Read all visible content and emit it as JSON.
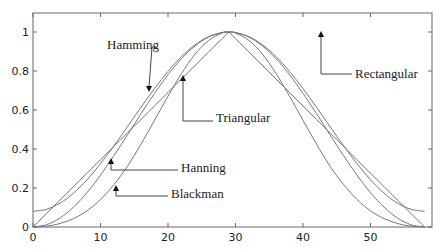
{
  "chart_data": {
    "type": "line",
    "title": "",
    "xlabel": "",
    "ylabel": "",
    "xlim": [
      0,
      59
    ],
    "ylim": [
      0,
      1.1
    ],
    "grid": false,
    "x_ticks": [
      0,
      10,
      20,
      30,
      40,
      50
    ],
    "y_ticks": [
      0,
      0.2,
      0.4,
      0.6,
      0.8,
      1
    ],
    "y_tick_labels": [
      "0",
      "0.2",
      "0.4",
      "0.6",
      "0.8",
      "1"
    ],
    "x": [
      0,
      2,
      4,
      6,
      8,
      10,
      12,
      14,
      16,
      18,
      20,
      22,
      24,
      26,
      28,
      29,
      30,
      32,
      34,
      36,
      38,
      40,
      42,
      44,
      46,
      48,
      50,
      52,
      54,
      56,
      58
    ],
    "series": [
      {
        "name": "Hamming",
        "values": [
          0.08,
          0.091,
          0.122,
          0.174,
          0.242,
          0.325,
          0.417,
          0.515,
          0.614,
          0.71,
          0.798,
          0.874,
          0.934,
          0.976,
          0.997,
          1.0,
          0.997,
          0.976,
          0.934,
          0.874,
          0.798,
          0.71,
          0.614,
          0.515,
          0.417,
          0.325,
          0.242,
          0.174,
          0.122,
          0.091,
          0.08
        ]
      },
      {
        "name": "Hanning",
        "values": [
          0.0,
          0.012,
          0.046,
          0.102,
          0.176,
          0.266,
          0.366,
          0.473,
          0.581,
          0.685,
          0.781,
          0.863,
          0.928,
          0.974,
          0.997,
          1.0,
          0.997,
          0.974,
          0.928,
          0.863,
          0.781,
          0.685,
          0.581,
          0.473,
          0.366,
          0.266,
          0.176,
          0.102,
          0.046,
          0.012,
          0.0
        ]
      },
      {
        "name": "Blackman",
        "values": [
          0.0,
          0.004,
          0.018,
          0.043,
          0.083,
          0.141,
          0.218,
          0.312,
          0.425,
          0.547,
          0.671,
          0.787,
          0.886,
          0.956,
          0.995,
          1.0,
          0.995,
          0.956,
          0.886,
          0.787,
          0.671,
          0.547,
          0.425,
          0.312,
          0.218,
          0.141,
          0.083,
          0.043,
          0.018,
          0.004,
          0.0
        ]
      },
      {
        "name": "Triangular",
        "values": [
          0.0,
          0.069,
          0.138,
          0.207,
          0.276,
          0.345,
          0.414,
          0.483,
          0.552,
          0.621,
          0.69,
          0.759,
          0.828,
          0.897,
          0.966,
          1.0,
          0.966,
          0.897,
          0.828,
          0.759,
          0.69,
          0.621,
          0.552,
          0.483,
          0.414,
          0.345,
          0.276,
          0.207,
          0.138,
          0.069,
          0.0
        ]
      },
      {
        "name": "Rectangular",
        "values": [
          1,
          1,
          1,
          1,
          1,
          1,
          1,
          1,
          1,
          1,
          1,
          1,
          1,
          1,
          1,
          1,
          1,
          1,
          1,
          1,
          1,
          1,
          1,
          1,
          1,
          1,
          1,
          1,
          1,
          1,
          1
        ]
      }
    ],
    "annotations": [
      {
        "label": "Hamming",
        "text_x": 107,
        "text_y": 49,
        "elbow": [
          152,
          47
        ],
        "tip": [
          149,
          92
        ],
        "dir": "down"
      },
      {
        "label": "Triangular",
        "text_x": 216,
        "text_y": 122,
        "elbow": [
          183,
          121
        ],
        "tip": [
          183,
          75
        ],
        "dir": "up"
      },
      {
        "label": "Rectangular",
        "text_x": 355,
        "text_y": 78,
        "elbow": [
          321,
          74
        ],
        "tip": [
          321,
          31
        ],
        "dir": "up"
      },
      {
        "label": "Hanning",
        "text_x": 181,
        "text_y": 172,
        "elbow": [
          111,
          170
        ],
        "tip": [
          111,
          158
        ],
        "dir": "up"
      },
      {
        "label": "Blackman",
        "text_x": 171,
        "text_y": 198,
        "elbow": [
          116,
          196
        ],
        "tip": [
          116,
          185
        ],
        "dir": "up"
      }
    ]
  },
  "colors": {
    "axis": "#555555",
    "lines": "#777777",
    "text": "#222222"
  }
}
